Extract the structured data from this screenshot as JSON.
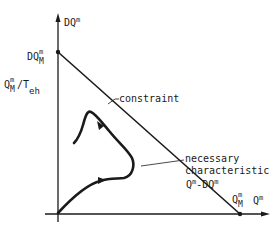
{
  "diagram": {
    "y_axis": {
      "label_base": "DQ",
      "label_sup": "m",
      "ticks": [
        {
          "base": "DQ",
          "sup": "m",
          "sub": "M"
        },
        {
          "base": "Q",
          "sup": "m",
          "sub": "M",
          "suffix": "/T",
          "suffix_sub": "eh"
        }
      ]
    },
    "x_axis": {
      "label_base": "Q",
      "label_sup": "m",
      "ticks": [
        {
          "base": "Q",
          "sup": "m",
          "sub": "M"
        }
      ]
    },
    "annotations": {
      "constraint": "constraint",
      "necessary_line1": "necessary",
      "necessary_line2": "characteristic",
      "necessary_line3_base1": "Q",
      "necessary_line3_sup1": "m",
      "necessary_line3_mid": "-DQ",
      "necessary_line3_sup2": "m"
    },
    "colors": {
      "ink": "#1a1a1a",
      "background": "#ffffff"
    }
  }
}
